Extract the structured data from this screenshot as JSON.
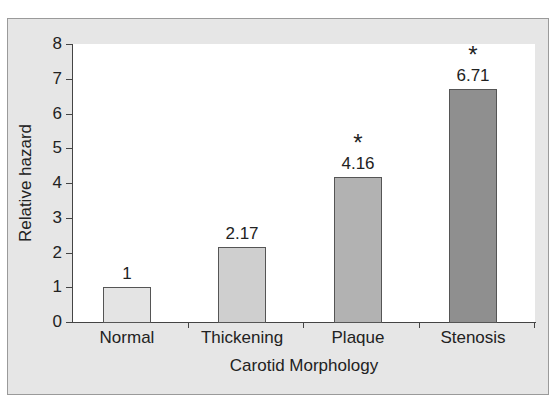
{
  "chart_data": {
    "type": "bar",
    "title": "",
    "xlabel": "Carotid Morphology",
    "ylabel": "Relative hazard",
    "categories": [
      "Normal",
      "Thickening",
      "Plaque",
      "Stenosis"
    ],
    "values": [
      1,
      2.17,
      4.16,
      6.71
    ],
    "value_labels": [
      "1",
      "2.17",
      "4.16",
      "6.71"
    ],
    "significance_markers": [
      "",
      "",
      "*",
      "*"
    ],
    "bar_colors": [
      "#e4e4e4",
      "#cfcfcf",
      "#b2b2b2",
      "#8f8f8f"
    ],
    "ylim": [
      0,
      8
    ],
    "yticks": [
      "0",
      "1",
      "2",
      "3",
      "4",
      "5",
      "6",
      "7",
      "8"
    ],
    "grid": false,
    "legend": null
  }
}
